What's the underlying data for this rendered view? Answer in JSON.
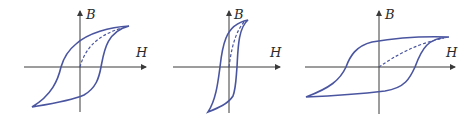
{
  "figure": {
    "colors": {
      "loop": "#4a55a0",
      "axis": "#3a3a3a",
      "text": "#2a2a2a"
    },
    "panels": [
      {
        "id": "panel-1",
        "y_axis_label": "B",
        "x_axis_label": "H",
        "loop_type": "moderate-width hysteresis loop",
        "has_initial_magnetization_curve": true
      },
      {
        "id": "panel-2",
        "y_axis_label": "B",
        "x_axis_label": "H",
        "loop_type": "narrow (soft) hysteresis loop",
        "has_initial_magnetization_curve": true
      },
      {
        "id": "panel-3",
        "y_axis_label": "B",
        "x_axis_label": "H",
        "loop_type": "wide (hard) hysteresis loop",
        "has_initial_magnetization_curve": true
      }
    ]
  }
}
